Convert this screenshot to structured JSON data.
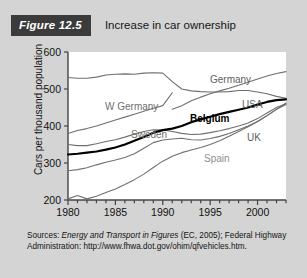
{
  "header": {
    "badge": "Figure 12.5",
    "title": "Increase in car ownership"
  },
  "axes": {
    "ylabel": "Cars per thousand population",
    "yticks": [
      "200",
      "300",
      "400",
      "500",
      "600"
    ],
    "xticks": [
      "1980",
      "1985",
      "1990",
      "1995",
      "2000"
    ]
  },
  "labels": {
    "w_germany": "W Germany",
    "sweden": "Sweden",
    "germany": "Germany",
    "usa": "USA",
    "belgium": "Belgium",
    "uk": "UK",
    "spain": "Spain"
  },
  "source": {
    "prefix": "Sources: ",
    "italic": "Energy and Transport in Figures",
    "middle": " (EC, 2005); Federal Highway Administration: ",
    "url": "http://www.fhwa.dot.gov/ohim/qfvehicles.htm."
  },
  "colors": {
    "badge_bg": "#3b3b3b",
    "panel_bg": "#d4d4d4",
    "plot_bg": "#ffffff",
    "line_gray": "#6f6f6f",
    "line_black": "#000000",
    "spain_label": "#8d8d8d"
  },
  "chart_data": {
    "type": "line",
    "title": "Increase in car ownership",
    "xlabel": "",
    "ylabel": "Cars per thousand population",
    "xlim": [
      1980,
      2003
    ],
    "ylim": [
      200,
      600
    ],
    "grid": false,
    "legend": "inline-labels",
    "x": [
      1980,
      1981,
      1982,
      1983,
      1984,
      1985,
      1986,
      1987,
      1988,
      1989,
      1990,
      1991,
      1992,
      1993,
      1994,
      1995,
      1996,
      1997,
      1998,
      1999,
      2000,
      2001,
      2002,
      2003
    ],
    "series": [
      {
        "name": "USA",
        "style": "gray",
        "values": [
          531,
          529,
          529,
          532,
          538,
          540,
          541,
          540,
          543,
          544,
          543,
          520,
          500,
          495,
          493,
          492,
          492,
          493,
          496,
          496,
          492,
          487,
          480,
          475
        ]
      },
      {
        "name": "W Germany",
        "style": "gray",
        "values": [
          380,
          388,
          393,
          400,
          408,
          416,
          424,
          432,
          440,
          448,
          455,
          490,
          null,
          null,
          null,
          null,
          null,
          null,
          null,
          null,
          null,
          null,
          null,
          null
        ]
      },
      {
        "name": "Germany",
        "style": "gray",
        "values": [
          null,
          null,
          null,
          null,
          null,
          null,
          null,
          null,
          null,
          null,
          null,
          445,
          455,
          468,
          478,
          487,
          495,
          502,
          510,
          518,
          527,
          535,
          542,
          547
        ]
      },
      {
        "name": "Sweden",
        "style": "gray",
        "values": [
          350,
          347,
          347,
          352,
          358,
          363,
          370,
          378,
          385,
          390,
          389,
          385,
          380,
          377,
          378,
          382,
          387,
          393,
          400,
          408,
          420,
          435,
          450,
          460
        ]
      },
      {
        "name": "Belgium",
        "style": "black",
        "values": [
          323,
          325,
          328,
          331,
          336,
          342,
          350,
          360,
          370,
          382,
          389,
          393,
          400,
          410,
          418,
          425,
          432,
          438,
          444,
          450,
          458,
          465,
          470,
          472
        ]
      },
      {
        "name": "UK",
        "style": "gray",
        "values": [
          279,
          282,
          287,
          295,
          302,
          308,
          315,
          325,
          340,
          355,
          362,
          365,
          367,
          363,
          362,
          366,
          372,
          380,
          390,
          400,
          412,
          428,
          445,
          462
        ]
      },
      {
        "name": "Spain",
        "style": "gray",
        "values": [
          203,
          212,
          203,
          210,
          220,
          230,
          242,
          255,
          270,
          288,
          305,
          318,
          328,
          335,
          342,
          350,
          360,
          372,
          385,
          398,
          412,
          428,
          445,
          458
        ]
      }
    ]
  }
}
